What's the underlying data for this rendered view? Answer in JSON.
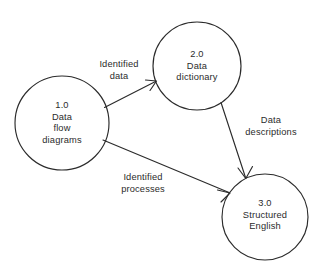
{
  "diagram": {
    "type": "data-flow-diagram",
    "canvas": {
      "width": 323,
      "height": 273,
      "background": "#ffffff"
    },
    "stroke_color": "#2b2b2b",
    "nodes": [
      {
        "id": "1.0",
        "name": "data-flow-diagrams-process",
        "number": "1.0",
        "lines": [
          "1.0",
          "Data",
          "flow",
          "diagrams"
        ],
        "cx": 62,
        "cy": 123,
        "r": 47
      },
      {
        "id": "2.0",
        "name": "data-dictionary-process",
        "number": "2.0",
        "lines": [
          "2.0",
          "Data",
          "dictionary"
        ],
        "cx": 197,
        "cy": 66,
        "r": 44
      },
      {
        "id": "3.0",
        "name": "structured-english-process",
        "number": "3.0",
        "lines": [
          "3.0",
          "Structured",
          "English"
        ],
        "cx": 265,
        "cy": 217,
        "r": 43
      }
    ],
    "flows": [
      {
        "id": "flow-identified-data",
        "from": "1.0",
        "to": "2.0",
        "lines": [
          "Identified",
          "data"
        ],
        "label_x": 119,
        "label_y": 71
      },
      {
        "id": "flow-data-descriptions",
        "from": "2.0",
        "to": "3.0",
        "lines": [
          "Data",
          "descriptions"
        ],
        "label_x": 271,
        "label_y": 127
      },
      {
        "id": "flow-identified-processes",
        "from": "1.0",
        "to": "3.0",
        "lines": [
          "Identified",
          "processes"
        ],
        "label_x": 143,
        "label_y": 184
      }
    ]
  }
}
